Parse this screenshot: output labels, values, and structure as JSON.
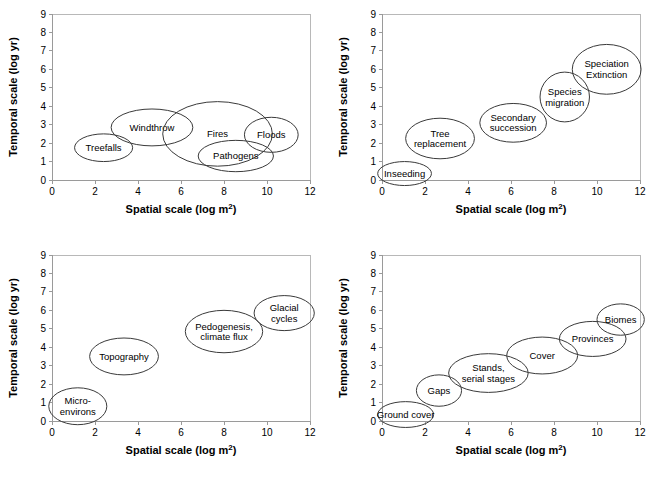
{
  "figure": {
    "width": 660,
    "height": 482,
    "background": "#ffffff",
    "bubble_stroke": "#3a3a3a",
    "axis_color": "#9a9a9a",
    "text_color": "#000000"
  },
  "axis": {
    "xlabel": "Spatial scale (log m",
    "xlabel_sup": "2",
    "xlabel_close": ")",
    "xlabel_full": "Spatial scale (log m2)",
    "ylabel": "Temporal scale (log yr)",
    "xticks": [
      "0",
      "2",
      "4",
      "6",
      "8",
      "10",
      "12"
    ],
    "yticks": [
      "0",
      "1",
      "2",
      "3",
      "4",
      "5",
      "6",
      "7",
      "8",
      "9"
    ],
    "xlim": [
      0,
      12
    ],
    "ylim": [
      0,
      9
    ]
  },
  "chart_data": [
    {
      "type": "scatter",
      "panel": "top-left",
      "title": "",
      "xlabel": "Spatial scale (log m2)",
      "ylabel": "Temporal scale (log yr)",
      "xlim": [
        0,
        12
      ],
      "ylim": [
        0,
        9
      ],
      "grid": false,
      "legend": "none",
      "marker": "ellipse",
      "points": [
        {
          "label": "Treefalls",
          "x": 2.4,
          "y": 1.75,
          "rx": 1.35,
          "ry": 0.75,
          "lines": [
            "Treefalls"
          ]
        },
        {
          "label": "Windthrow",
          "x": 4.65,
          "y": 2.85,
          "rx": 1.9,
          "ry": 1.0,
          "lines": [
            "Windthrow"
          ]
        },
        {
          "label": "Fires",
          "x": 7.7,
          "y": 2.5,
          "rx": 2.55,
          "ry": 1.75,
          "lines": [
            "Fires"
          ]
        },
        {
          "label": "Pathogens",
          "x": 8.55,
          "y": 1.3,
          "rx": 1.75,
          "ry": 0.85,
          "lines": [
            "Pathogens"
          ]
        },
        {
          "label": "Floods",
          "x": 10.2,
          "y": 2.45,
          "rx": 1.25,
          "ry": 0.95,
          "lines": [
            "Floods"
          ]
        }
      ]
    },
    {
      "type": "scatter",
      "panel": "top-right",
      "title": "",
      "xlabel": "Spatial scale (log m2)",
      "ylabel": "Temporal scale (log yr)",
      "xlim": [
        0,
        12
      ],
      "ylim": [
        0,
        9
      ],
      "grid": false,
      "legend": "none",
      "marker": "ellipse",
      "points": [
        {
          "label": "Inseeding",
          "x": 1.05,
          "y": 0.35,
          "rx": 1.25,
          "ry": 0.65,
          "lines": [
            "Inseeding"
          ]
        },
        {
          "label": "Tree replacement",
          "x": 2.7,
          "y": 2.25,
          "rx": 1.6,
          "ry": 1.1,
          "lines": [
            "Tree",
            "replacement"
          ]
        },
        {
          "label": "Secondary succession",
          "x": 6.1,
          "y": 3.1,
          "rx": 1.55,
          "ry": 1.05,
          "lines": [
            "Secondary",
            "succession"
          ]
        },
        {
          "label": "Species migration",
          "x": 8.5,
          "y": 4.5,
          "rx": 1.15,
          "ry": 1.35,
          "lines": [
            "Species",
            "migration"
          ]
        },
        {
          "label": "Speciation Extinction",
          "x": 10.45,
          "y": 6.0,
          "rx": 1.6,
          "ry": 1.35,
          "lines": [
            "Speciation",
            "Extinction"
          ]
        }
      ]
    },
    {
      "type": "scatter",
      "panel": "bottom-left",
      "title": "",
      "xlabel": "Spatial scale (log m2)",
      "ylabel": "Temporal scale (log yr)",
      "xlim": [
        0,
        12
      ],
      "ylim": [
        0,
        9
      ],
      "grid": false,
      "legend": "none",
      "marker": "ellipse",
      "points": [
        {
          "label": "Micro-environs",
          "x": 1.2,
          "y": 0.8,
          "rx": 1.35,
          "ry": 1.0,
          "lines": [
            "Micro-",
            "environs"
          ]
        },
        {
          "label": "Topography",
          "x": 3.35,
          "y": 3.5,
          "rx": 1.6,
          "ry": 1.0,
          "lines": [
            "Topography"
          ]
        },
        {
          "label": "Pedogenesis, climate flux",
          "x": 8.0,
          "y": 4.85,
          "rx": 1.8,
          "ry": 1.15,
          "lines": [
            "Pedogenesis,",
            "climate flux"
          ]
        },
        {
          "label": "Glacial cycles",
          "x": 10.8,
          "y": 5.85,
          "rx": 1.4,
          "ry": 0.95,
          "lines": [
            "Glacial",
            "cycles"
          ]
        }
      ]
    },
    {
      "type": "scatter",
      "panel": "bottom-right",
      "title": "",
      "xlabel": "Spatial scale (log m2)",
      "ylabel": "Temporal scale (log yr)",
      "xlim": [
        0,
        12
      ],
      "ylim": [
        0,
        9
      ],
      "grid": false,
      "legend": "none",
      "marker": "ellipse",
      "points": [
        {
          "label": "Ground cover",
          "x": 1.1,
          "y": 0.35,
          "rx": 1.3,
          "ry": 0.7,
          "lines": [
            "Ground cover"
          ]
        },
        {
          "label": "Gaps",
          "x": 2.65,
          "y": 1.65,
          "rx": 1.05,
          "ry": 0.85,
          "lines": [
            "Gaps"
          ]
        },
        {
          "label": "Stands, serial stages",
          "x": 4.95,
          "y": 2.6,
          "rx": 1.85,
          "ry": 1.05,
          "lines": [
            "Stands,",
            "serial stages"
          ]
        },
        {
          "label": "Cover",
          "x": 7.45,
          "y": 3.55,
          "rx": 1.65,
          "ry": 1.0,
          "lines": [
            "Cover"
          ]
        },
        {
          "label": "Provinces",
          "x": 9.8,
          "y": 4.45,
          "rx": 1.55,
          "ry": 0.95,
          "lines": [
            "Provinces"
          ]
        },
        {
          "label": "Biomes",
          "x": 11.1,
          "y": 5.5,
          "rx": 1.1,
          "ry": 0.85,
          "lines": [
            "Biomes"
          ]
        }
      ]
    }
  ]
}
